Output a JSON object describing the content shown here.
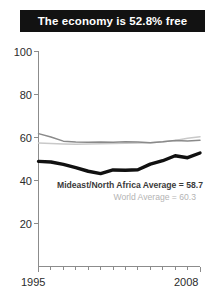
{
  "title": {
    "text": "The economy is 52.8% free"
  },
  "annotations": {
    "region_average": "Mideast/North Africa Average = 58.7",
    "world_average": "World Average = 60.3"
  },
  "colors": {
    "banner_bg": "#121212",
    "banner_text": "#ffffff",
    "country_line": "#111111",
    "region_line": "#8a8a8a",
    "world_line": "#c9c9c9",
    "axis": "#8c8c8c",
    "tick_text": "#2b2b2b",
    "annot_region_text": "#3a3a3a",
    "annot_world_text": "#b4b4b4"
  },
  "chart_data": {
    "type": "line",
    "title": "The economy is 52.8% free",
    "xlabel": "",
    "ylabel": "",
    "x": [
      1995,
      1996,
      1997,
      1998,
      1999,
      2000,
      2001,
      2002,
      2003,
      2004,
      2005,
      2006,
      2007,
      2008
    ],
    "xlim": [
      1995,
      2008
    ],
    "ylim": [
      0,
      100
    ],
    "yticks": [
      20,
      40,
      60,
      80,
      100
    ],
    "xticks": [
      1995,
      2008
    ],
    "xtick_labels": [
      "1995",
      "2008"
    ],
    "grid": false,
    "legend": "none",
    "series": [
      {
        "name": "Country score",
        "color": "#111111",
        "values": [
          48.9,
          48.6,
          47.5,
          46.0,
          44.3,
          43.2,
          44.9,
          44.8,
          45.0,
          47.6,
          49.2,
          51.5,
          50.6,
          52.8
        ]
      },
      {
        "name": "Mideast/North Africa Average",
        "color": "#8a8a8a",
        "values": [
          61.8,
          60.2,
          58.3,
          57.9,
          57.8,
          57.9,
          57.8,
          58.0,
          57.9,
          57.6,
          58.0,
          58.6,
          58.4,
          58.7
        ]
      },
      {
        "name": "World Average",
        "color": "#c9c9c9",
        "values": [
          57.4,
          57.2,
          57.0,
          56.9,
          57.0,
          57.1,
          57.2,
          57.3,
          57.5,
          57.6,
          58.0,
          58.6,
          59.6,
          60.3
        ]
      }
    ]
  }
}
